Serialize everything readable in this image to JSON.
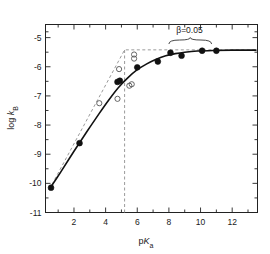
{
  "chart_data": {
    "type": "scatter",
    "title": "",
    "xlabel": "pKa",
    "ylabel": "log kB",
    "xlim": [
      0.2,
      13.6
    ],
    "ylim": [
      -11,
      -4.55
    ],
    "grid": false,
    "legend": null,
    "xticks": [
      2,
      4,
      6,
      8,
      10,
      12
    ],
    "xtick_labels": [
      "2",
      "4",
      "6",
      "8",
      "10",
      "12"
    ],
    "xminor_ticks": [
      1,
      3,
      5,
      7,
      9,
      11,
      13
    ],
    "yticks": [
      -11,
      -10,
      -9,
      -8,
      -7,
      -6,
      -5
    ],
    "ytick_labels": [
      "-11",
      "-10",
      "-9",
      "-8",
      "-7",
      "-6",
      "-5"
    ],
    "yminor_ticks": [
      -10.5,
      -9.5,
      -8.5,
      -7.5,
      -6.5,
      -5.5,
      -4.8
    ],
    "series": [
      {
        "name": "filled-circles",
        "marker": "filled-circle",
        "color": "#111111",
        "points": [
          [
            0.55,
            -10.15
          ],
          [
            2.35,
            -8.62
          ],
          [
            4.75,
            -6.52
          ],
          [
            4.9,
            -6.48
          ],
          [
            6.0,
            -6.02
          ],
          [
            7.3,
            -5.82
          ],
          [
            8.1,
            -5.52
          ],
          [
            8.8,
            -5.62
          ],
          [
            10.1,
            -5.45
          ],
          [
            11.0,
            -5.45
          ]
        ]
      },
      {
        "name": "open-circles",
        "marker": "open-circle",
        "color": "#555555",
        "points": [
          [
            3.6,
            -7.25
          ],
          [
            4.75,
            -7.1
          ],
          [
            4.85,
            -6.08
          ],
          [
            5.5,
            -6.65
          ],
          [
            5.65,
            -6.6
          ],
          [
            5.8,
            -5.72
          ],
          [
            5.8,
            -5.58
          ]
        ]
      }
    ],
    "curves": [
      {
        "name": "solid-fit-curve",
        "style": "solid",
        "color": "#111111",
        "points": [
          [
            0.45,
            -10.2
          ],
          [
            1.2,
            -9.58
          ],
          [
            2.0,
            -8.9
          ],
          [
            2.8,
            -8.24
          ],
          [
            3.6,
            -7.6
          ],
          [
            4.2,
            -7.14
          ],
          [
            4.8,
            -6.72
          ],
          [
            5.4,
            -6.38
          ],
          [
            6.0,
            -6.1
          ],
          [
            6.6,
            -5.9
          ],
          [
            7.2,
            -5.74
          ],
          [
            7.8,
            -5.62
          ],
          [
            8.4,
            -5.55
          ],
          [
            9.0,
            -5.5
          ],
          [
            9.8,
            -5.46
          ],
          [
            10.8,
            -5.44
          ],
          [
            12.0,
            -5.43
          ],
          [
            13.5,
            -5.43
          ]
        ]
      },
      {
        "name": "dashed-piecewise-fit",
        "style": "dashed",
        "color": "#999999",
        "points": [
          [
            0.45,
            -10.2
          ],
          [
            5.2,
            -5.42
          ],
          [
            13.5,
            -5.42
          ]
        ]
      }
    ],
    "vertical_line": {
      "name": "breakpoint-line",
      "style": "dashed",
      "color": "#999999",
      "x": 5.2,
      "y_from": -11,
      "y_to": -5.42
    },
    "annotations": [
      {
        "name": "beta-annotation",
        "text": "β=0.05",
        "x": 9.3,
        "y": -4.85,
        "brace": {
          "x_from": 8.0,
          "x_to": 10.7,
          "y": -5.22
        }
      }
    ]
  }
}
